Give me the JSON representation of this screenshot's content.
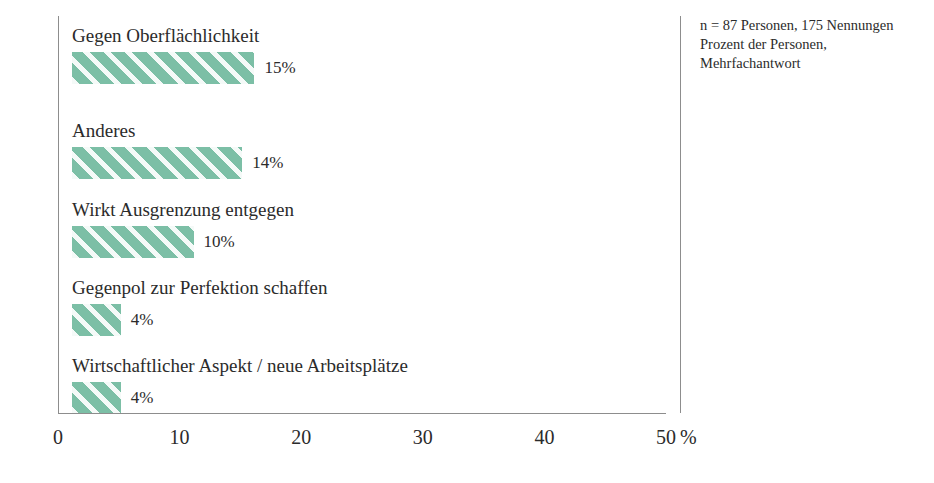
{
  "chart_data": {
    "type": "bar",
    "orientation": "horizontal",
    "title": "",
    "subtitle": "",
    "xlabel": "%",
    "ylabel": "",
    "xlim": [
      0,
      50
    ],
    "grid": false,
    "legend": null,
    "categories": [
      "Gegen Oberflächlichkeit",
      "Anderes",
      "Wirkt Ausgrenzung entgegen",
      "Gegenpol zur Perfektion schaffen",
      "Wirtschaftlicher Aspekt / neue Arbeitsplätze"
    ],
    "values": [
      15,
      14,
      10,
      4,
      4
    ],
    "value_labels": [
      "15%",
      "14%",
      "10%",
      "4%",
      "4%"
    ],
    "xticks": [
      0,
      10,
      20,
      30,
      40,
      50
    ],
    "xtick_labels": [
      "0",
      "10",
      "20",
      "30",
      "40",
      "50"
    ],
    "annotations": [
      "n = 87 Personen, 175 Nennungen",
      "Prozent der Personen,",
      "Mehrfachantwort"
    ],
    "bar_color": "#7cbfa6",
    "bar_hatch": "diagonal-stripes",
    "axis_color": "#8d8d8d",
    "text_color": "#2b2b2b",
    "background_color": "#ffffff"
  },
  "axis": {
    "unit_label": "%"
  },
  "notes": {
    "line1": "n = 87 Personen, 175 Nennungen",
    "line2": "Prozent der Personen,",
    "line3": "Mehrfachantwort"
  }
}
